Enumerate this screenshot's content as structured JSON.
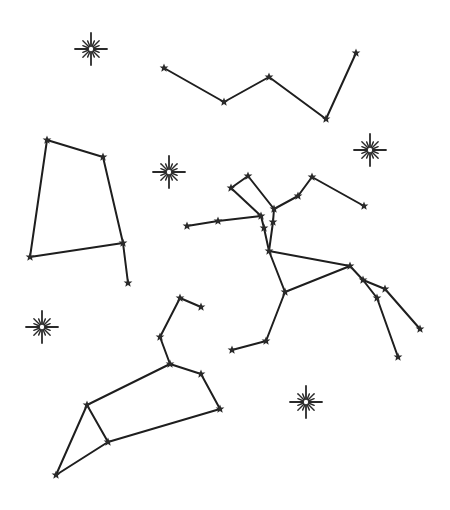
{
  "image": {
    "width": 450,
    "height": 510,
    "background": "#ffffff",
    "ink_color": "#1e1e1e",
    "description": "Hand-drawn constellation illustration"
  },
  "constellations": [
    {
      "name": "top-zigzag",
      "stars": [
        [
          164,
          68
        ],
        [
          224,
          102
        ],
        [
          269,
          77
        ],
        [
          326,
          119
        ],
        [
          356,
          53
        ]
      ],
      "edges": [
        [
          0,
          1
        ],
        [
          1,
          2
        ],
        [
          2,
          3
        ],
        [
          3,
          4
        ]
      ]
    },
    {
      "name": "left-quadrilateral",
      "stars": [
        [
          47,
          140
        ],
        [
          103,
          157
        ],
        [
          123,
          243
        ],
        [
          30,
          257
        ],
        [
          128,
          283
        ]
      ],
      "edges": [
        [
          0,
          1
        ],
        [
          1,
          2
        ],
        [
          2,
          3
        ],
        [
          3,
          0
        ],
        [
          2,
          4
        ]
      ]
    },
    {
      "name": "centaur",
      "stars": [
        [
          231,
          188
        ],
        [
          248,
          176
        ],
        [
          261,
          216
        ],
        [
          274,
          209
        ],
        [
          298,
          196
        ],
        [
          312,
          177
        ],
        [
          364,
          206
        ],
        [
          187,
          226
        ],
        [
          218,
          221
        ],
        [
          264,
          228
        ],
        [
          273,
          222
        ],
        [
          269,
          251
        ],
        [
          350,
          266
        ],
        [
          285,
          292
        ],
        [
          363,
          280
        ],
        [
          385,
          289
        ],
        [
          377,
          298
        ],
        [
          420,
          329
        ],
        [
          398,
          357
        ],
        [
          266,
          341
        ],
        [
          232,
          350
        ]
      ],
      "edges": [
        [
          0,
          1
        ],
        [
          0,
          2
        ],
        [
          1,
          3
        ],
        [
          3,
          4
        ],
        [
          4,
          5
        ],
        [
          5,
          6
        ],
        [
          7,
          8
        ],
        [
          8,
          2
        ],
        [
          2,
          9
        ],
        [
          3,
          10
        ],
        [
          9,
          11
        ],
        [
          10,
          11
        ],
        [
          11,
          12
        ],
        [
          11,
          13
        ],
        [
          13,
          12
        ],
        [
          12,
          14
        ],
        [
          14,
          15
        ],
        [
          14,
          16
        ],
        [
          15,
          17
        ],
        [
          16,
          18
        ],
        [
          13,
          19
        ],
        [
          19,
          20
        ]
      ]
    },
    {
      "name": "leo",
      "stars": [
        [
          180,
          298
        ],
        [
          201,
          307
        ],
        [
          160,
          337
        ],
        [
          170,
          364
        ],
        [
          201,
          374
        ],
        [
          220,
          409
        ],
        [
          87,
          405
        ],
        [
          108,
          442
        ],
        [
          56,
          475
        ]
      ],
      "edges": [
        [
          0,
          1
        ],
        [
          0,
          2
        ],
        [
          2,
          3
        ],
        [
          3,
          4
        ],
        [
          4,
          5
        ],
        [
          3,
          6
        ],
        [
          6,
          7
        ],
        [
          7,
          5
        ],
        [
          6,
          8
        ],
        [
          8,
          7
        ]
      ]
    }
  ],
  "sparkles": [
    {
      "x": 91,
      "y": 49,
      "r": 16
    },
    {
      "x": 169,
      "y": 172,
      "r": 16
    },
    {
      "x": 370,
      "y": 150,
      "r": 16
    },
    {
      "x": 42,
      "y": 327,
      "r": 16
    },
    {
      "x": 306,
      "y": 402,
      "r": 16
    }
  ]
}
